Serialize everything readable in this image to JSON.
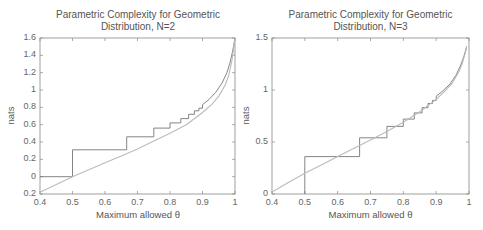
{
  "chart_data": [
    {
      "type": "line",
      "title": "Parametric Complexity for Geometric Distribution, N=2",
      "title_lines": [
        "Parametric Complexity for Geometric",
        "Distribution, N=2"
      ],
      "xlabel": "Maximum allowed θ",
      "ylabel": "nats",
      "xlim": [
        0.4,
        1.0
      ],
      "ylim": [
        -0.2,
        1.6
      ],
      "xticks": [
        "0.4",
        "0.5",
        "0.6",
        "0.7",
        "0.8",
        "0.9",
        "1"
      ],
      "yticks": [
        "0.2",
        "0",
        "0.2",
        "0.4",
        "0.6",
        "0.8",
        "1",
        "1.2",
        "1.4",
        "1.6"
      ],
      "ytick_values": [
        -0.2,
        0,
        0.2,
        0.4,
        0.6,
        0.8,
        1.0,
        1.2,
        1.4,
        1.6
      ],
      "grid": false,
      "series": [
        {
          "name": "exact (step)",
          "style": "step",
          "color": "#777777",
          "x": [
            0.4,
            0.5,
            0.5,
            0.6667,
            0.6667,
            0.75,
            0.75,
            0.8,
            0.8,
            0.8333,
            0.8333,
            0.8571,
            0.8571,
            0.875,
            0.875,
            0.8889,
            0.8889,
            0.9,
            0.9,
            0.92,
            0.94,
            0.96,
            0.975,
            0.985,
            0.993,
            1.0
          ],
          "y": [
            0,
            0,
            0.31,
            0.31,
            0.46,
            0.46,
            0.56,
            0.56,
            0.62,
            0.62,
            0.67,
            0.67,
            0.72,
            0.72,
            0.76,
            0.76,
            0.79,
            0.79,
            0.83,
            0.89,
            0.97,
            1.08,
            1.2,
            1.32,
            1.45,
            1.6
          ]
        },
        {
          "name": "asymptotic approximation",
          "style": "smooth",
          "color": "#bbbbbb",
          "x": [
            0.4,
            0.45,
            0.5,
            0.55,
            0.6,
            0.65,
            0.7,
            0.75,
            0.8,
            0.85,
            0.9,
            0.93,
            0.95,
            0.97,
            0.98,
            0.99,
            0.995,
            1.0
          ],
          "y": [
            -0.18,
            -0.09,
            0.0,
            0.08,
            0.16,
            0.24,
            0.32,
            0.41,
            0.5,
            0.6,
            0.74,
            0.84,
            0.93,
            1.06,
            1.16,
            1.33,
            1.46,
            1.6
          ]
        }
      ]
    },
    {
      "type": "line",
      "title": "Parametric Complexity for Geometric Distribution, N=3",
      "title_lines": [
        "Parametric Complexity for Geometric",
        "Distribution, N=3"
      ],
      "xlabel": "Maximum allowed θ",
      "ylabel": "nats",
      "xlim": [
        0.4,
        1.0
      ],
      "ylim": [
        0,
        1.5
      ],
      "xticks": [
        "0.4",
        "0.5",
        "0.6",
        "0.7",
        "0.8",
        "0.9",
        "1"
      ],
      "yticks": [
        "0",
        "0.5",
        "1",
        "1.5"
      ],
      "ytick_values": [
        0,
        0.5,
        1.0,
        1.5
      ],
      "grid": false,
      "series": [
        {
          "name": "exact (step)",
          "style": "step",
          "color": "#777777",
          "x": [
            0.5,
            0.5,
            0.6667,
            0.6667,
            0.75,
            0.75,
            0.8,
            0.8,
            0.8333,
            0.8333,
            0.8571,
            0.8571,
            0.875,
            0.875,
            0.8889,
            0.8889,
            0.9,
            0.9,
            0.92,
            0.94,
            0.96,
            0.975,
            0.985,
            0.993
          ],
          "y": [
            0,
            0.36,
            0.36,
            0.54,
            0.54,
            0.65,
            0.65,
            0.72,
            0.72,
            0.78,
            0.78,
            0.83,
            0.83,
            0.87,
            0.87,
            0.9,
            0.9,
            0.94,
            0.99,
            1.05,
            1.14,
            1.24,
            1.33,
            1.42
          ]
        },
        {
          "name": "asymptotic approximation",
          "style": "smooth",
          "color": "#bbbbbb",
          "x": [
            0.4,
            0.45,
            0.5,
            0.55,
            0.6,
            0.65,
            0.7,
            0.75,
            0.8,
            0.85,
            0.9,
            0.93,
            0.95,
            0.97,
            0.98,
            0.99,
            0.993
          ],
          "y": [
            0.02,
            0.11,
            0.2,
            0.28,
            0.36,
            0.44,
            0.52,
            0.6,
            0.69,
            0.79,
            0.91,
            1.0,
            1.07,
            1.18,
            1.26,
            1.37,
            1.42
          ]
        }
      ]
    }
  ]
}
